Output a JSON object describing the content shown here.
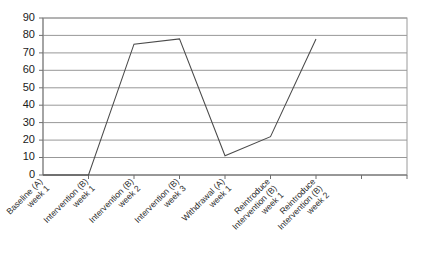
{
  "chart_data": {
    "type": "line",
    "title": "",
    "subtitle": "",
    "xlabel": "",
    "ylabel": "",
    "ylim": [
      0,
      90
    ],
    "ytick_step": 10,
    "yticks": [
      0,
      10,
      20,
      30,
      40,
      50,
      60,
      70,
      80,
      90
    ],
    "grid": true,
    "grid_axis": "y",
    "legend": false,
    "legend_position": "none",
    "line_color": "#4a4a4a",
    "categories": [
      "Baseline (A) week 1",
      "Intervention (B) week 1",
      "Intervention (B) week 2",
      "Intervention (B) week 3",
      "Withdrawal (A) week 1",
      "Reintroduce Intervention (B) week 1",
      "Reintroduce Intervention (B) week 2"
    ],
    "category_lines": [
      [
        "Baseline (A)",
        "week 1"
      ],
      [
        "Intervention (B)",
        "week 1"
      ],
      [
        "Intervention (B)",
        "week 2"
      ],
      [
        "Intervention (B)",
        "week 3"
      ],
      [
        "Withdrawal (A)",
        "week 1"
      ],
      [
        "Reintroduce",
        "Intervention (B)",
        "week 1"
      ],
      [
        "Reintroduce",
        "Intervention (B)",
        "week 2"
      ]
    ],
    "values": [
      0,
      0,
      75,
      78,
      11,
      22,
      78
    ],
    "series": [
      {
        "name": "",
        "values": [
          0,
          0,
          75,
          78,
          11,
          22,
          78
        ]
      }
    ]
  },
  "axes": {
    "y_tick_labels": [
      "90",
      "80",
      "70",
      "60",
      "50",
      "40",
      "30",
      "20",
      "10",
      "0"
    ]
  }
}
